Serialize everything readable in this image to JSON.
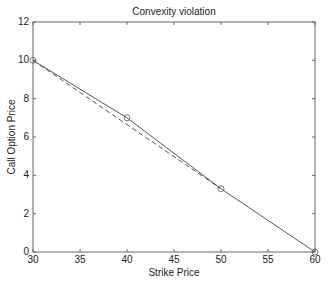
{
  "chart_data": {
    "type": "line",
    "title": "Convexity violation",
    "xlabel": "Strike Price",
    "ylabel": "Call Option Price",
    "xlim": [
      30,
      60
    ],
    "ylim": [
      0,
      12
    ],
    "xticks": [
      30,
      35,
      40,
      45,
      50,
      55,
      60
    ],
    "yticks": [
      0,
      2,
      4,
      6,
      8,
      10,
      12
    ],
    "grid": false,
    "series": [
      {
        "name": "Option prices",
        "style": "solid-with-circle-markers",
        "x": [
          30,
          40,
          50,
          60
        ],
        "y": [
          10,
          7,
          3.3,
          0
        ]
      },
      {
        "name": "Convex interpolation",
        "style": "dashed",
        "x": [
          30,
          50
        ],
        "y": [
          10,
          3.3
        ]
      }
    ]
  }
}
